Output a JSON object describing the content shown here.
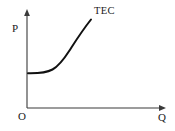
{
  "figure": {
    "type": "economics-cost-curve-diagram",
    "background_color": "#ffffff",
    "axes": {
      "y_axis_label": "P",
      "x_axis_label": "Q",
      "origin_label": "O",
      "axis_color": "#3a3a3a",
      "y_axis": {
        "x_px": 27,
        "top_px": 10,
        "bottom_px": 108,
        "arrow": "up"
      },
      "x_axis": {
        "y_px": 108,
        "left_px": 27,
        "right_px": 165,
        "arrow": "right"
      }
    },
    "curve": {
      "label": "TEC",
      "color": "#111111",
      "stroke_width": 2,
      "description": "flat then upward-sloping convex curve",
      "points": [
        {
          "x": 28,
          "y": 73
        },
        {
          "x": 38,
          "y": 73
        },
        {
          "x": 46,
          "y": 72
        },
        {
          "x": 53,
          "y": 69
        },
        {
          "x": 60,
          "y": 63
        },
        {
          "x": 67,
          "y": 54
        },
        {
          "x": 74,
          "y": 45
        },
        {
          "x": 81,
          "y": 34
        },
        {
          "x": 86,
          "y": 27
        },
        {
          "x": 91,
          "y": 20
        }
      ]
    }
  }
}
